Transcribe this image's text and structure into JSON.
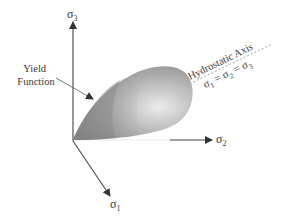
{
  "diagram": {
    "axes": {
      "sigma1": {
        "symbol": "σ",
        "sub": "1"
      },
      "sigma2": {
        "symbol": "σ",
        "sub": "2"
      },
      "sigma3": {
        "symbol": "σ",
        "sub": "3"
      }
    },
    "labels": {
      "yield_line1": "Yield",
      "yield_line2": "Function",
      "hydrostatic_title": "Hydrostatic Axis",
      "hydrostatic_eq_s1": "σ",
      "hydrostatic_eq_sub1": "1",
      "hydrostatic_eq_eq1": " = σ",
      "hydrostatic_eq_sub2": "2",
      "hydrostatic_eq_eq2": " = σ",
      "hydrostatic_eq_sub3": "3"
    },
    "colors": {
      "axis": "#444444",
      "surface_dark": "#7a7a7a",
      "surface_mid": "#a8a8a8",
      "surface_light": "#e6e6e6",
      "dashed": "#a0a0a0"
    }
  }
}
